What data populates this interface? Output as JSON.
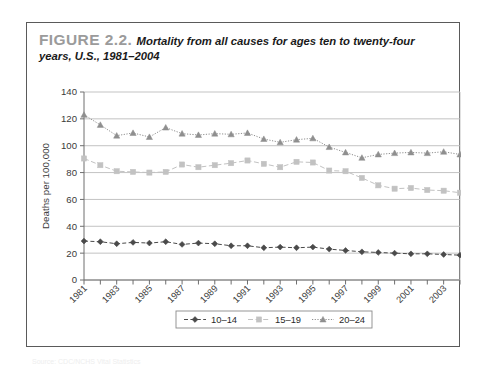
{
  "figure": {
    "label": "FIGURE 2.2.",
    "caption_line1": "Mortality from all causes for ages ten to twenty-four",
    "caption_line2": "years, U.S., 1981–2004"
  },
  "source_note": "Source: CDC/NCHS Vital Statistics",
  "colors": {
    "series_10_14": "#4a4a4a",
    "series_15_19": "#c2c2c2",
    "series_20_24": "#8f8f8f",
    "gridline": "#bcbcbc",
    "axis": "#6e6e6e",
    "frame": "#5a5a5a",
    "fig_label": "#9b9b9b"
  },
  "chart_data": {
    "type": "line",
    "title": "Mortality from all causes for ages ten to twenty-four years, U.S., 1981–2004",
    "xlabel": "",
    "ylabel": "Deaths per 100,000",
    "ylim": [
      0,
      140
    ],
    "ytick_values": [
      0,
      20,
      40,
      60,
      80,
      100,
      120,
      140
    ],
    "grid": true,
    "legend_position": "bottom-center",
    "x": [
      1981,
      1982,
      1983,
      1984,
      1985,
      1986,
      1987,
      1988,
      1989,
      1990,
      1991,
      1992,
      1993,
      1994,
      1995,
      1996,
      1997,
      1998,
      1999,
      2000,
      2001,
      2002,
      2003,
      2004
    ],
    "xtick_labels_shown": [
      "1981",
      "1983",
      "1985",
      "1987",
      "1989",
      "1991",
      "1993",
      "1995",
      "1997",
      "1999",
      "2001",
      "2003"
    ],
    "series": [
      {
        "name": "10–14",
        "marker": "diamond",
        "color": "#4a4a4a",
        "values": [
          29,
          28.5,
          27,
          28,
          27.5,
          28.5,
          26.5,
          27.5,
          27,
          25.5,
          25.5,
          24,
          24.5,
          24,
          24.5,
          23,
          22,
          21,
          20.5,
          20,
          19.5,
          19.5,
          19,
          18.5
        ]
      },
      {
        "name": "15–19",
        "marker": "square",
        "color": "#c2c2c2",
        "values": [
          90.5,
          85.5,
          81,
          80.5,
          80,
          80.5,
          86,
          84,
          85.5,
          87,
          89,
          86.5,
          84,
          88,
          87.5,
          81.5,
          81,
          76,
          70.5,
          68,
          68.5,
          67,
          66.5,
          65
        ]
      },
      {
        "name": "20–24",
        "marker": "triangle",
        "color": "#8f8f8f",
        "values": [
          123,
          115.5,
          107.5,
          109.5,
          106.5,
          113.5,
          109,
          108,
          109,
          108.5,
          109.5,
          105,
          102.5,
          104.5,
          105.5,
          99,
          95,
          91,
          93.5,
          94.5,
          95,
          94.5,
          95.5,
          93.5
        ]
      }
    ]
  },
  "legend": {
    "items": [
      {
        "label": "10–14"
      },
      {
        "label": "15–19"
      },
      {
        "label": "20–24"
      }
    ]
  }
}
